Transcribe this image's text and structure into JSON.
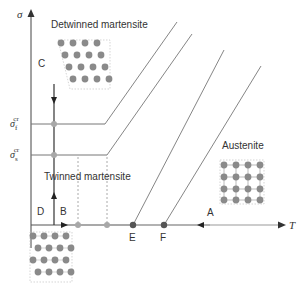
{
  "figure": {
    "axes": {
      "y_label": "σ",
      "x_label": "T"
    },
    "stress_levels": [
      {
        "name": "sigma_f_cr",
        "base": "σ",
        "sub": "f",
        "sup": "cr"
      },
      {
        "name": "sigma_s_cr",
        "base": "σ",
        "sub": "s",
        "sup": "cr"
      }
    ],
    "regions": {
      "detwinned": "Detwinned martensite",
      "twinned": "Twinned martensite",
      "austenite": "Austenite"
    },
    "path_labels": {
      "A": "A",
      "B": "B",
      "C": "C",
      "D": "D"
    },
    "points": {
      "E": "E",
      "F": "F"
    },
    "colors": {
      "line": "#555555",
      "axis": "#444444",
      "atom": "#8a8a8a",
      "light_point": "#a8a8a8",
      "dark_point": "#555555",
      "dashed": "#aaaaaa"
    }
  }
}
